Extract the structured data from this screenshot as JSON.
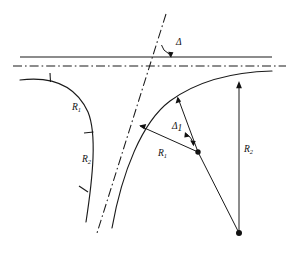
{
  "figure": {
    "type": "engineering-line-diagram",
    "background_color": "#ffffff",
    "line_color": "#1a1a1a",
    "width": 290,
    "height": 257
  },
  "labels": {
    "delta": "Δ",
    "delta_sub1_base": "Δ",
    "delta_sub1_sub": "1",
    "radius_left_upper_base": "R",
    "radius_left_upper_sub": "1",
    "radius_left_lower_base": "R",
    "radius_left_lower_sub": "2",
    "radius_right_inner_base": "R",
    "radius_right_inner_sub": "1",
    "radius_right_outer_base": "R",
    "radius_right_outer_sub": "2"
  },
  "geometry": {
    "solid_horizontal_line": {
      "x1": 20,
      "y1": 57,
      "x2": 272,
      "y2": 57
    },
    "dashdot_horizontal_line": {
      "x1": 13,
      "y1": 66,
      "x2": 286,
      "y2": 66
    },
    "dashdot_diagonal_line": {
      "x1": 166,
      "y1": 14,
      "x2": 97,
      "y2": 233
    },
    "left_curve": "M 20,80 C 52,76 76,86 88,112 C 97,134 93,176 86,222",
    "right_curve": "M 272,71 C 232,72 196,82 170,101 C 142,122 122,172 112,228",
    "delta_angle_vertex": {
      "x": 159,
      "y": 42
    },
    "delta_arrow_tip": {
      "x": 171,
      "y": 56
    },
    "center_vertex_dot": {
      "x": 198,
      "y": 152
    },
    "bottom_vertex_dot": {
      "x": 239,
      "y": 233
    },
    "radius_arrow_left_tip": {
      "x": 140,
      "y": 126
    },
    "radius_arrow_upper_tip": {
      "x": 178,
      "y": 97
    },
    "vertical_arrow": {
      "x": 239,
      "y_top": 82,
      "y_bottom": 233
    },
    "left_curve_ticks": [
      {
        "x": 50,
        "y": 77,
        "len": 9
      },
      {
        "x": 89,
        "y": 133,
        "len": 9
      },
      {
        "x": 85,
        "y": 190,
        "len": 9
      }
    ]
  }
}
